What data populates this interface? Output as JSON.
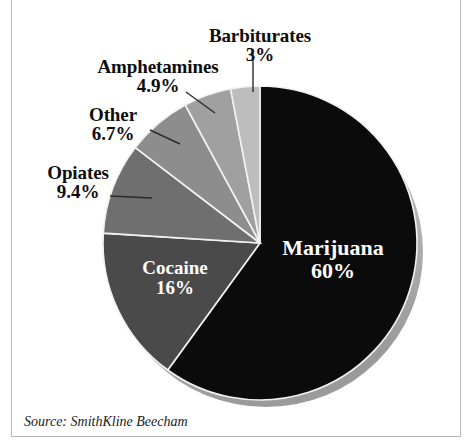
{
  "figure": {
    "source_note": "Source: SmithKline Beecham"
  },
  "chart_data": {
    "type": "pie",
    "title": "",
    "subtitle": "",
    "xlabel": "",
    "ylabel": "",
    "legend_position": "none",
    "grid": false,
    "units": "percent",
    "start_angle_deg": 0,
    "direction": "clockwise",
    "categories": [
      "Marijuana",
      "Cocaine",
      "Opiates",
      "Other",
      "Amphetamines",
      "Barbiturates"
    ],
    "values": [
      60,
      16,
      9.4,
      6.7,
      4.9,
      3
    ],
    "value_labels": [
      "60%",
      "16%",
      "9.4%",
      "6.7%",
      "4.9%",
      "3%"
    ],
    "colors": [
      "#0b0b0b",
      "#4a4a4a",
      "#6f6f6f",
      "#8d8d8d",
      "#a0a0a0",
      "#bdbdbd"
    ],
    "slices": [
      {
        "name": "Marijuana",
        "value": 60,
        "value_label": "60%",
        "color": "#0b0b0b",
        "label_placement": "inside",
        "label_color": "#ffffff"
      },
      {
        "name": "Cocaine",
        "value": 16,
        "value_label": "16%",
        "color": "#4a4a4a",
        "label_placement": "inside",
        "label_color": "#ffffff"
      },
      {
        "name": "Opiates",
        "value": 9.4,
        "value_label": "9.4%",
        "color": "#6f6f6f",
        "label_placement": "outside",
        "label_color": "#0d0d0d"
      },
      {
        "name": "Other",
        "value": 6.7,
        "value_label": "6.7%",
        "color": "#8d8d8d",
        "label_placement": "outside",
        "label_color": "#0d0d0d"
      },
      {
        "name": "Amphetamines",
        "value": 4.9,
        "value_label": "4.9%",
        "color": "#a0a0a0",
        "label_placement": "outside",
        "label_color": "#0d0d0d"
      },
      {
        "name": "Barbiturates",
        "value": 3,
        "value_label": "3%",
        "color": "#bdbdbd",
        "label_placement": "outside",
        "label_color": "#0d0d0d"
      }
    ]
  }
}
